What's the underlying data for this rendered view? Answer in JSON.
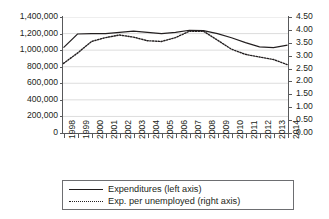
{
  "chart_data": {
    "type": "line",
    "title": "",
    "xlabel": "",
    "ylabel": "",
    "grid": true,
    "legend_position": "bottom",
    "categories": [
      "1998",
      "1999",
      "2000",
      "2001",
      "2002",
      "2003",
      "2004",
      "2005",
      "2006",
      "2007",
      "2008",
      "2009",
      "2010",
      "2011",
      "2012",
      "2013",
      "2014"
    ],
    "axes": {
      "left": {
        "label": "Expenditures",
        "ticks": [
          "0",
          "200,000",
          "400,000",
          "600,000",
          "800,000",
          "1,000,000",
          "1,200,000",
          "1,400,000"
        ],
        "tick_values": [
          0,
          200000,
          400000,
          600000,
          800000,
          1000000,
          1200000,
          1400000
        ],
        "ylim": [
          0,
          1400000
        ]
      },
      "right": {
        "label": "Exp. per unemployed",
        "ticks": [
          "0.00",
          "0.50",
          "1.00",
          "1.50",
          "2.00",
          "2.50",
          "3.00",
          "3.50",
          "4.00",
          "4.50"
        ],
        "tick_values": [
          0,
          0.5,
          1.0,
          1.5,
          2.0,
          2.5,
          3.0,
          3.5,
          4.0,
          4.5
        ],
        "ylim": [
          0,
          4.5
        ]
      }
    },
    "series": [
      {
        "name": "Expenditures (left axis)",
        "axis": "left",
        "style": "solid",
        "color": "#231f20",
        "values": [
          1030000,
          1195000,
          1200000,
          1200000,
          1215000,
          1230000,
          1215000,
          1200000,
          1215000,
          1240000,
          1235000,
          1200000,
          1150000,
          1090000,
          1040000,
          1030000,
          1060000
        ]
      },
      {
        "name": "Exp. per unemployed (right axis)",
        "axis": "right",
        "style": "dotted",
        "color": "#231f20",
        "values": [
          2.7,
          3.1,
          3.55,
          3.7,
          3.8,
          3.72,
          3.58,
          3.55,
          3.7,
          3.95,
          3.95,
          3.6,
          3.25,
          3.05,
          2.95,
          2.85,
          2.65
        ]
      }
    ]
  },
  "legend": {
    "items": [
      {
        "label": "Expenditures (left axis)",
        "style": "solid"
      },
      {
        "label": "Exp. per unemployed (right axis)",
        "style": "dotted"
      }
    ]
  },
  "colors": {
    "axis": "#58595b",
    "grid": "#d9d9d9",
    "text": "#231f20",
    "background": "#ffffff"
  }
}
